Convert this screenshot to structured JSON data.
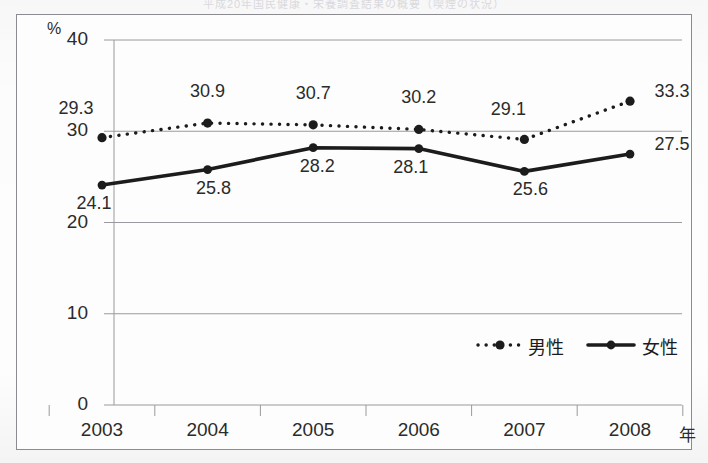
{
  "scan": {
    "cut_title": "平成20年国民健康・栄養調査結果の概要（喫煙の状況）",
    "background_color": "#fbfbfb",
    "frame_color": "#8c8c90"
  },
  "chart_data": {
    "type": "line",
    "title": "",
    "xlabel": "年",
    "ylabel": "%",
    "unit_label": "%",
    "x_axis_suffix": "年",
    "categories": [
      "2003",
      "2004",
      "2005",
      "2006",
      "2007",
      "2008"
    ],
    "ylim": [
      0,
      40
    ],
    "yticks": [
      "0",
      "10",
      "20",
      "30",
      "40"
    ],
    "ytick_values": [
      0,
      10,
      20,
      30,
      40
    ],
    "grid": "horizontal",
    "legend_position": "bottom-right",
    "series": [
      {
        "name": "男性",
        "style": "dotted",
        "color": "#1c1c1c",
        "values": [
          29.3,
          30.9,
          30.7,
          30.2,
          29.1,
          33.3
        ],
        "labels": [
          "29.3",
          "30.9",
          "30.7",
          "30.2",
          "29.1",
          "33.3"
        ]
      },
      {
        "name": "女性",
        "style": "solid",
        "color": "#1c1c1c",
        "values": [
          24.1,
          25.8,
          28.2,
          28.1,
          25.6,
          27.5
        ],
        "labels": [
          "24.1",
          "25.8",
          "28.2",
          "28.1",
          "25.6",
          "27.5"
        ]
      }
    ],
    "legend": [
      {
        "label": "男性",
        "marker": "dotted-line-with-dot"
      },
      {
        "label": "女性",
        "marker": "solid-line-with-dot"
      }
    ]
  }
}
